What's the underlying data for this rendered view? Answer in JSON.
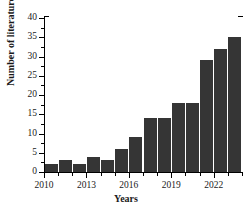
{
  "chart_data": {
    "type": "bar",
    "title": "",
    "subtitle": "",
    "xlabel": "Years",
    "ylabel": "Number of literatures",
    "categories": [
      "2010",
      "2011",
      "2012",
      "2013",
      "2014",
      "2015",
      "2016",
      "2017",
      "2018",
      "2019",
      "2020",
      "2021",
      "2022",
      "2023"
    ],
    "values": [
      2,
      3,
      2,
      4,
      3,
      6,
      9,
      14,
      14,
      18,
      18,
      29,
      32,
      35
    ],
    "ylim": [
      0,
      40
    ],
    "xlim": [
      2010,
      2024
    ],
    "ytick_labels": [
      "0",
      "5",
      "10",
      "15",
      "20",
      "25",
      "30",
      "35",
      "40"
    ],
    "ytick_values": [
      0,
      5,
      10,
      15,
      20,
      25,
      30,
      35,
      40
    ],
    "ytick_minor_step": 2.5,
    "xtick_labels": [
      "2010",
      "2013",
      "2016",
      "2019",
      "2022"
    ],
    "xtick_values": [
      2010,
      2013,
      2016,
      2019,
      2022
    ],
    "grid": false,
    "legend": false,
    "legend_position": "none",
    "bar_color": "#353535",
    "axis_color": "#000000",
    "background_color": "#ffffff"
  }
}
